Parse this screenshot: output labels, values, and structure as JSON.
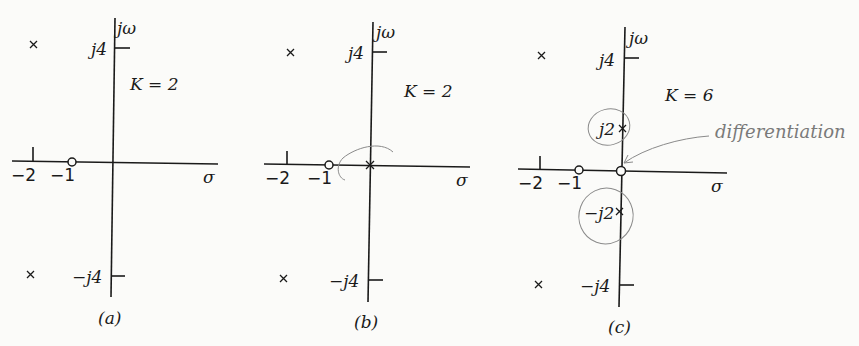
{
  "panels": [
    {
      "id": "a",
      "caption": "(a)",
      "gain_label": "K = 2",
      "axis_labels": {
        "imag": "jω",
        "real": "σ"
      },
      "tick_labels": {
        "j4": "j4",
        "neg_j4": "−j4",
        "neg2": "−2",
        "neg1": "−1"
      },
      "poles": [
        "-2+j4",
        "-2-j4"
      ],
      "zeros": [
        "-1"
      ]
    },
    {
      "id": "b",
      "caption": "(b)",
      "gain_label": "K = 2",
      "axis_labels": {
        "imag": "jω",
        "real": "σ"
      },
      "tick_labels": {
        "j4": "j4",
        "neg_j4": "−j4",
        "neg2": "−2",
        "neg1": "−1"
      },
      "poles": [
        "-2+j4",
        "-2-j4",
        "0"
      ],
      "zeros": [
        "-1"
      ]
    },
    {
      "id": "c",
      "caption": "(c)",
      "gain_label": "K = 6",
      "axis_labels": {
        "imag": "jω",
        "real": "σ"
      },
      "tick_labels": {
        "j4": "j4",
        "neg_j4": "−j4",
        "neg2": "−2",
        "neg1": "−1",
        "j2": "j2",
        "neg_j2": "−j2"
      },
      "poles": [
        "-2+j4",
        "-2-j4",
        "j2",
        "-j2"
      ],
      "zeros": [
        "-1",
        "0"
      ],
      "annotation": "differentiation"
    }
  ],
  "colors": {
    "ink": "#1a1a1a",
    "pencil": "#8a8a8a",
    "background": "#fbfbf9"
  }
}
